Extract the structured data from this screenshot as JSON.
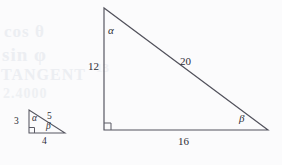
{
  "figure": {
    "caption": "",
    "background_color": "#fbfbfc",
    "line_color": "#52525c",
    "text_color": "#2e2e36",
    "ghost_artifacts": [
      {
        "text": "cos θ"
      },
      {
        "text": "sin φ"
      },
      {
        "text": "TANGENT"
      },
      {
        "text": "2.4000"
      },
      {
        "text": "13"
      }
    ],
    "shapes": [
      {
        "id": "small-triangle",
        "name": "small-right-triangle",
        "type": "right-triangle",
        "vertices": {
          "apex": [
            29,
            110
          ],
          "right_angle": [
            29,
            133
          ],
          "base_right": [
            65,
            133
          ]
        },
        "right_angle_at": "bottom-left",
        "labels": {
          "vertical_leg": "3",
          "horizontal_leg": "4",
          "hypotenuse": "5",
          "angle_apex": "α",
          "angle_base_right": "β"
        }
      },
      {
        "id": "large-triangle",
        "name": "large-right-triangle",
        "type": "right-triangle",
        "vertices": {
          "apex": [
            104,
            8
          ],
          "right_angle": [
            104,
            130
          ],
          "base_right": [
            268,
            130
          ]
        },
        "right_angle_at": "bottom-left",
        "labels": {
          "vertical_leg": "12",
          "horizontal_leg": "16",
          "hypotenuse": "20",
          "angle_apex": "α",
          "angle_base_right": "β"
        }
      }
    ]
  }
}
